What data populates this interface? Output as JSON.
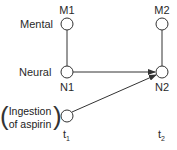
{
  "diagram": {
    "row_labels": {
      "mental": "Mental",
      "neural": "Neural"
    },
    "nodes": {
      "m1": "M1",
      "m2": "M2",
      "n1": "N1",
      "n2": "N2"
    },
    "cause": {
      "line1": "Ingestion",
      "line2": "of aspirin",
      "open_paren": "(",
      "close_paren": ")"
    },
    "time_labels": {
      "t1_base": "t",
      "t1_sub": "1",
      "t2_base": "t",
      "t2_sub": "2"
    },
    "edges": [
      {
        "from": "M1",
        "to": "N1",
        "type": "line"
      },
      {
        "from": "M2",
        "to": "N2",
        "type": "line"
      },
      {
        "from": "N1",
        "to": "N2",
        "type": "arrow"
      },
      {
        "from": "Ingestion",
        "to": "N2",
        "type": "arrow"
      }
    ],
    "stroke_color": "#333333"
  }
}
